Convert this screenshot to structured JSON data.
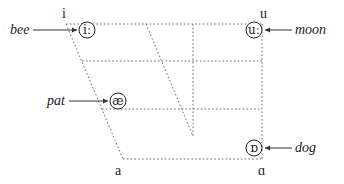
{
  "diagram": {
    "title": "",
    "type": "vowel-quadrilateral",
    "corner_labels": {
      "top_left": "i",
      "top_right": "u",
      "bottom_left": "a",
      "bottom_right": "ɑ"
    },
    "vowels": [
      {
        "symbol": "iː",
        "word": "bee",
        "position": "close-front"
      },
      {
        "symbol": "uː",
        "word": "moon",
        "position": "close-back"
      },
      {
        "symbol": "æ",
        "word": "pat",
        "position": "near-open-front"
      },
      {
        "symbol": "ɒ",
        "word": "dog",
        "position": "open-back"
      }
    ]
  }
}
